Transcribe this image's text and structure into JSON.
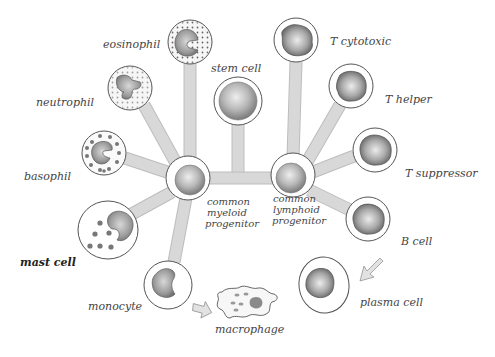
{
  "diagram": {
    "type": "cell-lineage",
    "nodes": {
      "stem_cell": {
        "label": "stem cell"
      },
      "cmp": {
        "label_lines": [
          "common",
          "myeloid",
          "progenitor"
        ]
      },
      "clp": {
        "label_lines": [
          "common",
          "lymphoid",
          "progenitor"
        ]
      },
      "eosinophil": {
        "label": "eosinophil"
      },
      "neutrophil": {
        "label": "neutrophil"
      },
      "basophil": {
        "label": "basophil"
      },
      "mast_cell": {
        "label": "mast cell"
      },
      "monocyte": {
        "label": "monocyte"
      },
      "macrophage": {
        "label": "macrophage"
      },
      "t_cytotoxic": {
        "label": "T cytotoxic"
      },
      "t_helper": {
        "label": "T helper"
      },
      "t_suppressor": {
        "label": "T suppressor"
      },
      "b_cell": {
        "label": "B cell"
      },
      "plasma_cell": {
        "label": "plasma cell"
      }
    },
    "edges": [
      [
        "stem_cell",
        "cmp"
      ],
      [
        "stem_cell",
        "clp"
      ],
      [
        "cmp",
        "eosinophil"
      ],
      [
        "cmp",
        "neutrophil"
      ],
      [
        "cmp",
        "basophil"
      ],
      [
        "cmp",
        "mast_cell"
      ],
      [
        "cmp",
        "monocyte"
      ],
      [
        "clp",
        "t_cytotoxic"
      ],
      [
        "clp",
        "t_helper"
      ],
      [
        "clp",
        "t_suppressor"
      ],
      [
        "clp",
        "b_cell"
      ]
    ],
    "arrows": [
      {
        "from": "monocyte",
        "to": "macrophage"
      },
      {
        "from": "b_cell",
        "to": "plasma_cell"
      }
    ]
  }
}
